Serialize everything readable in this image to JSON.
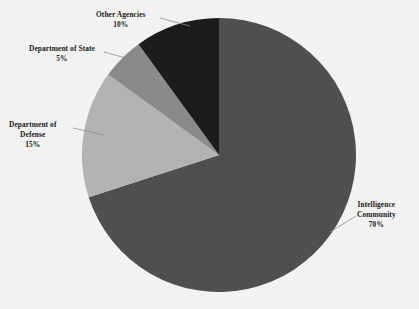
{
  "chart_data": {
    "type": "pie",
    "title": "",
    "categories": [
      "Intelligence Community",
      "Department of Defense",
      "Department of State",
      "Other Agencies"
    ],
    "values": [
      70,
      15,
      5,
      10
    ],
    "value_labels": [
      "70%",
      "15%",
      "5%",
      "10%"
    ],
    "colors": [
      "#4f4f4f",
      "#b3b3b3",
      "#8a8a8a",
      "#1c1c1c"
    ],
    "legend": "none",
    "labels_position": "outside-with-leader-lines",
    "start_angle_deg": 0,
    "direction": "clockwise",
    "units": "percent",
    "total": 100
  },
  "labels": {
    "other_agencies": {
      "name": "Other Agencies",
      "percent": "10%"
    },
    "department_of_state": {
      "name": "Department of State",
      "percent": "5%"
    },
    "department_of_defense": {
      "name_line1": "Department of",
      "name_line2": "Defense",
      "percent": "15%"
    },
    "intelligence_community": {
      "name_line1": "Intelligence",
      "name_line2": "Community",
      "percent": "70%"
    }
  },
  "colors": {
    "background": "#f2f2f2",
    "slice_intelligence_community": "#4f4f4f",
    "slice_department_of_defense": "#b3b3b3",
    "slice_department_of_state": "#8a8a8a",
    "slice_other_agencies": "#1c1c1c",
    "label_text": "#1a1a1a",
    "leader_line": "#8c8c8c"
  }
}
